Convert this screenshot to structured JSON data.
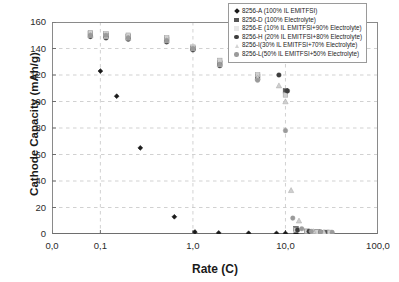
{
  "chart_data": {
    "type": "scatter",
    "title": "",
    "xlabel": "Rate (C)",
    "ylabel": "Cathode Capacity (mAh/g)",
    "xscale": "log",
    "xlim": [
      0.03,
      100.0
    ],
    "ylim": [
      0,
      160
    ],
    "ytick_labels": [
      "0",
      "20",
      "40",
      "60",
      "80",
      "100",
      "120",
      "140",
      "160"
    ],
    "ytick_values": [
      0,
      20,
      40,
      60,
      80,
      100,
      120,
      140,
      160
    ],
    "xtick_labels": [
      "0,0",
      "0,1",
      "1,0",
      "10,0",
      "100,0"
    ],
    "xtick_values": [
      0.03,
      0.1,
      1.0,
      10.0,
      100.0
    ],
    "grid": "dashed horizontal and vertical gridlines",
    "legend_position": "top-right inside plot",
    "series": [
      {
        "name": "8256-A (100% IL EMITFSI)",
        "marker": "diamond",
        "color": "#1a1a1a",
        "points": [
          {
            "x": 0.1,
            "y": 123
          },
          {
            "x": 0.15,
            "y": 104
          },
          {
            "x": 0.27,
            "y": 65
          },
          {
            "x": 0.63,
            "y": 13
          },
          {
            "x": 1.05,
            "y": 1.5
          },
          {
            "x": 1.9,
            "y": 0.8
          },
          {
            "x": 4.0,
            "y": 0.6
          },
          {
            "x": 8.0,
            "y": 0.5
          },
          {
            "x": 10.0,
            "y": 0.5
          },
          {
            "x": 13.0,
            "y": 0.5
          }
        ]
      },
      {
        "name": "8256-D (100% Electrolyte)",
        "marker": "square",
        "color": "#555555",
        "points": [
          {
            "x": 0.078,
            "y": 151
          },
          {
            "x": 0.115,
            "y": 150
          },
          {
            "x": 0.2,
            "y": 149
          },
          {
            "x": 0.52,
            "y": 147
          },
          {
            "x": 1.0,
            "y": 140
          },
          {
            "x": 1.95,
            "y": 129
          },
          {
            "x": 5.0,
            "y": 119
          },
          {
            "x": 10.0,
            "y": 108
          },
          {
            "x": 13.0,
            "y": 4
          },
          {
            "x": 17.0,
            "y": 2
          },
          {
            "x": 22.0,
            "y": 1.5
          },
          {
            "x": 28.0,
            "y": 1.2
          }
        ]
      },
      {
        "name": "8256-E (10% IL EMITFSI+90% Electrolyte)",
        "marker": "square-light",
        "color": "#d0d0d0",
        "points": [
          {
            "x": 0.078,
            "y": 152
          },
          {
            "x": 0.115,
            "y": 151
          },
          {
            "x": 0.2,
            "y": 150
          },
          {
            "x": 0.52,
            "y": 148
          },
          {
            "x": 1.0,
            "y": 141
          },
          {
            "x": 1.95,
            "y": 131
          },
          {
            "x": 5.0,
            "y": 120
          },
          {
            "x": 10.0,
            "y": 105
          },
          {
            "x": 13.0,
            "y": 3
          },
          {
            "x": 17.0,
            "y": 2
          },
          {
            "x": 22.0,
            "y": 1.5
          },
          {
            "x": 30.0,
            "y": 1.2
          }
        ]
      },
      {
        "name": "8256-H (20% IL EMITFSI+80% Electrolyte)",
        "marker": "circle",
        "color": "#3d3d3d",
        "points": [
          {
            "x": 0.078,
            "y": 149
          },
          {
            "x": 0.115,
            "y": 148
          },
          {
            "x": 0.2,
            "y": 147
          },
          {
            "x": 0.52,
            "y": 145
          },
          {
            "x": 1.0,
            "y": 139
          },
          {
            "x": 1.95,
            "y": 127
          },
          {
            "x": 5.0,
            "y": 117
          },
          {
            "x": 8.5,
            "y": 120
          },
          {
            "x": 10.5,
            "y": 108
          },
          {
            "x": 13.5,
            "y": 3
          },
          {
            "x": 18.0,
            "y": 2
          },
          {
            "x": 24.0,
            "y": 1.5
          }
        ]
      },
      {
        "name": "8256-I (30% IL EMITFSI+70% Electrolyte)",
        "marker": "triangle",
        "color": "#cfcfcf",
        "points": [
          {
            "x": 0.078,
            "y": 150
          },
          {
            "x": 0.115,
            "y": 149
          },
          {
            "x": 0.2,
            "y": 148
          },
          {
            "x": 0.52,
            "y": 146
          },
          {
            "x": 1.0,
            "y": 140
          },
          {
            "x": 1.95,
            "y": 128
          },
          {
            "x": 5.0,
            "y": 118
          },
          {
            "x": 8.5,
            "y": 112
          },
          {
            "x": 10.0,
            "y": 100
          },
          {
            "x": 11.5,
            "y": 33
          },
          {
            "x": 14.0,
            "y": 10
          },
          {
            "x": 20.0,
            "y": 2
          },
          {
            "x": 26.0,
            "y": 1.4
          }
        ]
      },
      {
        "name": "8256-L(50% IL EMITFSI+50% Electrolyte)",
        "marker": "circle-gray",
        "color": "#9a9a9a",
        "points": [
          {
            "x": 0.078,
            "y": 150
          },
          {
            "x": 0.115,
            "y": 150
          },
          {
            "x": 0.2,
            "y": 148
          },
          {
            "x": 0.52,
            "y": 146
          },
          {
            "x": 1.0,
            "y": 140
          },
          {
            "x": 1.95,
            "y": 128
          },
          {
            "x": 5.0,
            "y": 116
          },
          {
            "x": 10.0,
            "y": 78
          },
          {
            "x": 12.0,
            "y": 12
          },
          {
            "x": 15.0,
            "y": 4
          },
          {
            "x": 19.0,
            "y": 2
          },
          {
            "x": 24.0,
            "y": 1.5
          },
          {
            "x": 32.0,
            "y": 1.2
          }
        ]
      }
    ]
  },
  "axes": {
    "ylabel": "Cathode Capacity (mAh/g)",
    "xlabel": "Rate (C)"
  },
  "legend": {
    "items": [
      {
        "label": "8256-A (100% IL EMITFSI)"
      },
      {
        "label": "8256-D (100% Electrolyte)"
      },
      {
        "label": "8256-E (10% IL EMITFSI+90% Electrolyte)"
      },
      {
        "label": "8256-H (20% IL EMITFSI+80% Electrolyte)"
      },
      {
        "label": "8256-I(30% IL EMITFSI+70% Electrolyte)"
      },
      {
        "label": "8256-L(50% IL EMITFSI+50% Electrolyte)"
      }
    ]
  }
}
